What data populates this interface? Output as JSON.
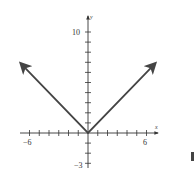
{
  "chart_data": {
    "type": "line",
    "title": "",
    "function": "y = |x|",
    "xlabel": "x",
    "ylabel": "y",
    "xlim": [
      -7,
      7
    ],
    "ylim": [
      -3,
      11
    ],
    "x_tick_labels": [
      "-6",
      "6"
    ],
    "y_tick_labels": [
      "10",
      "-3"
    ],
    "x_ticks": [
      -6,
      -5,
      -4,
      -3,
      -2,
      -1,
      1,
      2,
      3,
      4,
      5,
      6
    ],
    "y_ticks": [
      -3,
      -2,
      -1,
      1,
      2,
      3,
      4,
      5,
      6,
      7,
      8,
      9,
      10
    ],
    "grid": false,
    "legend": null,
    "series": [
      {
        "name": "y = |x|",
        "x": [
          -6.9,
          0,
          6.9
        ],
        "y": [
          6.9,
          0,
          6.9
        ],
        "arrows_at_ends": true
      }
    ]
  },
  "labels": {
    "x_axis": "x",
    "y_axis": "y",
    "x_neg": "−6",
    "x_pos": "6",
    "y_top": "10",
    "y_bottom": "−3"
  },
  "colors": {
    "curve": "#444444",
    "axis": "#333333"
  }
}
